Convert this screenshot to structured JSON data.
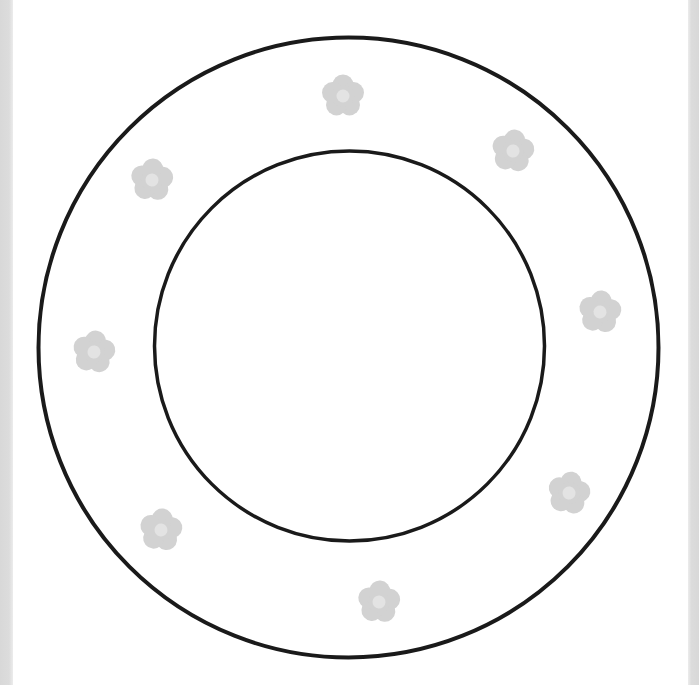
{
  "page": {
    "width": 699,
    "height": 685,
    "background": "#ffffff"
  },
  "frame": {
    "edge_color": "#d9d9d9"
  },
  "outer_circle": {
    "cx": 348.5,
    "cy": 347.5,
    "r": 310,
    "stroke": "#1a1a1a",
    "stroke_width": 4
  },
  "inner_circle": {
    "cx": 349.5,
    "cy": 346,
    "r": 195,
    "stroke": "#1a1a1a",
    "stroke_width": 3.5
  },
  "flower_style": {
    "petal_color": "#d2d2d2",
    "center_color": "#e3e3e3",
    "size": 46
  },
  "flowers": [
    {
      "id": "top",
      "x": 343,
      "y": 96,
      "rotate": 0
    },
    {
      "id": "top-right",
      "x": 513,
      "y": 151,
      "rotate": 8
    },
    {
      "id": "right",
      "x": 600,
      "y": 312,
      "rotate": 6
    },
    {
      "id": "bottom-right",
      "x": 569,
      "y": 493,
      "rotate": 10
    },
    {
      "id": "bottom",
      "x": 379,
      "y": 602,
      "rotate": 4
    },
    {
      "id": "bottom-left",
      "x": 161,
      "y": 530,
      "rotate": 6
    },
    {
      "id": "left",
      "x": 94,
      "y": 352,
      "rotate": 8
    },
    {
      "id": "top-left",
      "x": 152,
      "y": 180,
      "rotate": 4
    }
  ]
}
